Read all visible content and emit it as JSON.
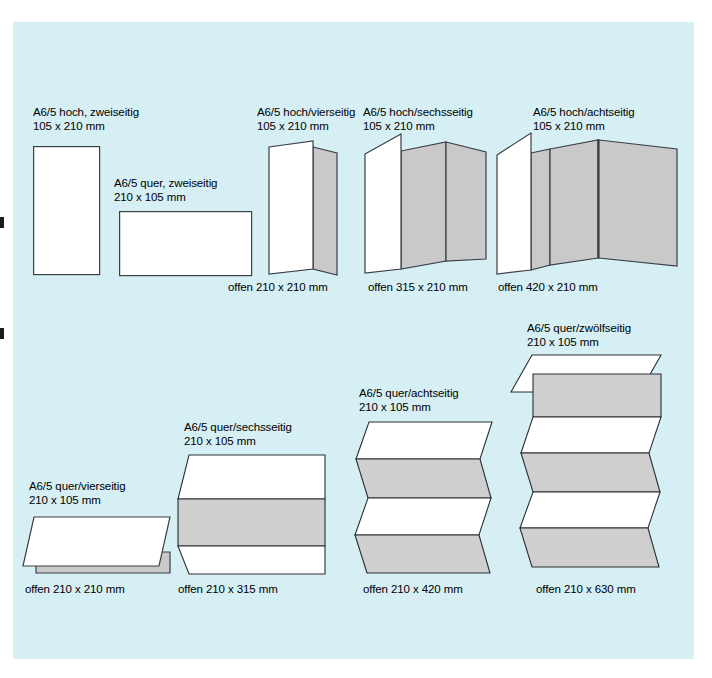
{
  "page": {
    "background_color": "#ffffff",
    "panel_color": "#d6eff5",
    "ink_color": "#000000",
    "paper_white": "#ffffff",
    "paper_gray": "#c9c9c9",
    "edge_stroke": "#3a3f45"
  },
  "figures": [
    {
      "id": "a65-hoch-zweiseitig",
      "title": "A6/5 hoch, zweiseitig",
      "size": "105 x 210 mm",
      "open_caption": ""
    },
    {
      "id": "a65-quer-zweiseitig",
      "title": "A6/5 quer, zweiseitig",
      "size": "210 x 105 mm",
      "open_caption": ""
    },
    {
      "id": "a65-hoch-vierseitig",
      "title": "A6/5 hoch/vierseitig",
      "size": "105 x 210 mm",
      "open_caption": "offen 210 x 210 mm"
    },
    {
      "id": "a65-hoch-sechsseitig",
      "title": "A6/5 hoch/sechsseitig",
      "size": "105 x 210 mm",
      "open_caption": "offen 315 x 210 mm"
    },
    {
      "id": "a65-hoch-achtseitig",
      "title": "A6/5 hoch/achtseitig",
      "size": "105 x 210 mm",
      "open_caption": "offen 420 x 210 mm"
    },
    {
      "id": "a65-quer-vierseitig",
      "title": "A6/5 quer/vierseitig",
      "size": "210 x 105 mm",
      "open_caption": "offen 210 x 210 mm"
    },
    {
      "id": "a65-quer-sechsseitig",
      "title": "A6/5 quer/sechsseitig",
      "size": "210 x 105 mm",
      "open_caption": "offen 210 x 315 mm"
    },
    {
      "id": "a65-quer-achtseitig",
      "title": "A6/5 quer/achtseitig",
      "size": "210 x 105 mm",
      "open_caption": "offen 210 x 420 mm"
    },
    {
      "id": "a65-quer-zwoelfseitig",
      "title": "A6/5 quer/zwölfseitig",
      "size": "210 x 105 mm",
      "open_caption": "offen 210 x 630 mm"
    }
  ]
}
